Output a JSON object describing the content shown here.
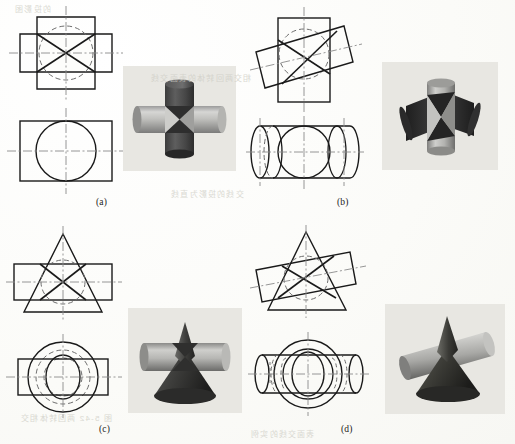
{
  "figure": {
    "kind": "engineering-drawing-plate",
    "panels": [
      {
        "id": "a",
        "caption": "(a)",
        "subject": "Two equal cylinders intersecting at right angles, axes coplanar and perpendicular",
        "views": [
          {
            "name": "front-view",
            "outline": "cross-shaped overlap of two equal squares",
            "hidden_circle": true,
            "intersection_curve": "two straight lines forming an X"
          },
          {
            "name": "top-view",
            "outline": "rectangle with inscribed circle",
            "hidden_circle": false,
            "intersection_curve": "circle"
          }
        ],
        "model": "cross-of-two-cylinders"
      },
      {
        "id": "b",
        "caption": "(b)",
        "subject": "Two equal cylinders intersecting obliquely, axes crossing at an angle",
        "views": [
          {
            "name": "front-view",
            "outline": "upright rectangle overlapped by a tilted rectangle",
            "hidden_circle": true,
            "intersection_curve": "two straight lines forming a skewed X"
          },
          {
            "name": "top-view",
            "outline": "horizontal cylinder with end ellipses and central circle",
            "hidden_circle": true,
            "intersection_curve": "ellipse"
          }
        ],
        "model": "oblique-cross-of-two-cylinders"
      },
      {
        "id": "c",
        "caption": "(c)",
        "subject": "Cone and cylinder intersecting at right angles, axes coplanar and perpendicular",
        "views": [
          {
            "name": "front-view",
            "outline": "triangle overlapped by a horizontal rectangle",
            "hidden_circle": true,
            "intersection_curve": "two straight lines forming an X"
          },
          {
            "name": "top-view",
            "outline": "concentric circles with rectangle and central lens",
            "hidden_circle": true,
            "intersection_curve": "lens-shaped ellipse pair"
          }
        ],
        "model": "cone-through-cylinder"
      },
      {
        "id": "d",
        "caption": "(d)",
        "subject": "Cone and cylinder intersecting obliquely",
        "views": [
          {
            "name": "front-view",
            "outline": "triangle overlapped by a tilted rectangle",
            "hidden_circle": true,
            "intersection_curve": "two straight lines forming a skewed X"
          },
          {
            "name": "top-view",
            "outline": "circles with horizontal cylinder and central lens",
            "hidden_circle": true,
            "intersection_curve": "lens-shaped ellipse pair"
          }
        ],
        "model": "cone-through-oblique-cylinder"
      }
    ]
  },
  "line_styles": {
    "visible": "#1a1a1a",
    "hidden": "#6d6d6d",
    "center": "#8a8a8a",
    "photo_background": "#e8e7e2",
    "page_background": "#fdfdfb"
  },
  "bleed_text": [
    {
      "text": "的投影图",
      "x": 14,
      "y": 3
    },
    {
      "text": "相交两回转体的表面交线",
      "x": 150,
      "y": 72
    },
    {
      "text": "交线的投影为直线",
      "x": 170,
      "y": 188
    },
    {
      "text": "图 5-42 两回转体相交",
      "x": 20,
      "y": 412
    },
    {
      "text": "表面交线的实例",
      "x": 250,
      "y": 428
    }
  ]
}
